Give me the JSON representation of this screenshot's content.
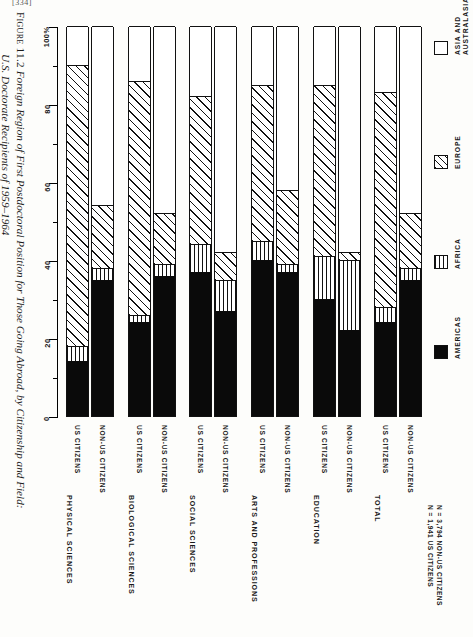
{
  "page_number": "[334]",
  "caption": {
    "figure_label": "Figure 11.2",
    "line1": "Foreign Region of First Postdoctoral Position for Those Going Abroad, by Citizenship and Field:",
    "line2": "U.S. Doctorate Recipients of 1959–1964"
  },
  "notes": {
    "line1": "N = 1,941 US CITIZENS",
    "line2": "N = 3,794 NON-US CITIZENS"
  },
  "legend": {
    "items": [
      {
        "label": "AMERICAS",
        "pattern": "solid-black",
        "color": "#0a0a0a",
        "icon": "legend-swatch-icon"
      },
      {
        "label": "AFRICA",
        "pattern": "vertical-lines",
        "color": "#111111",
        "icon": "legend-swatch-icon"
      },
      {
        "label": "EUROPE",
        "pattern": "diagonal-hatch",
        "color": "#111111",
        "icon": "legend-swatch-icon"
      },
      {
        "label": "ASIA AND AUSTRALASIA",
        "label_l1": "ASIA AND",
        "label_l2": "AUSTRALASIA",
        "pattern": "white",
        "color": "#ffffff",
        "icon": "legend-swatch-icon"
      }
    ]
  },
  "chart_data": {
    "type": "bar",
    "subtype": "stacked-bar-100-percent",
    "orientation": "vertical",
    "title": "Foreign Region of First Postdoctoral Position for Those Going Abroad, by Citizenship and Field: U.S. Doctorate Recipients of 1959–1964",
    "xlabel": "",
    "ylabel": "",
    "ylim": [
      0,
      100
    ],
    "yticks": [
      0,
      20,
      40,
      60,
      80,
      100
    ],
    "ytick_labels": [
      "0",
      "20",
      "40",
      "60",
      "80",
      "100%"
    ],
    "yminor_ticks": [
      10,
      30,
      50,
      70,
      90
    ],
    "grid": false,
    "legend_position": "right",
    "series": [
      {
        "name": "AMERICAS",
        "values": [
          14,
          35,
          24,
          36,
          37,
          27,
          40,
          37,
          30,
          22,
          24,
          35
        ]
      },
      {
        "name": "AFRICA",
        "values": [
          4,
          3,
          2,
          3,
          7,
          8,
          5,
          2,
          11,
          18,
          4,
          3
        ]
      },
      {
        "name": "EUROPE",
        "values": [
          72,
          16,
          60,
          13,
          38,
          7,
          40,
          19,
          44,
          2,
          55,
          14
        ]
      },
      {
        "name": "ASIA AND AUSTRALASIA",
        "values": [
          10,
          46,
          14,
          48,
          18,
          58,
          15,
          42,
          15,
          58,
          17,
          48
        ]
      }
    ],
    "categories": [
      "PHYSICAL SCIENCES / US CITIZENS",
      "PHYSICAL SCIENCES / NON-US CITIZENS",
      "BIOLOGICAL SCIENCES / US CITIZENS",
      "BIOLOGICAL SCIENCES / NON-US CITIZENS",
      "SOCIAL SCIENCES / US CITIZENS",
      "SOCIAL SCIENCES / NON-US CITIZENS",
      "ARTS AND PROFESSIONS / US CITIZENS",
      "ARTS AND PROFESSIONS / NON-US CITIZENS",
      "EDUCATION / US CITIZENS",
      "EDUCATION / NON-US CITIZENS",
      "TOTAL / US CITIZENS",
      "TOTAL / NON-US CITIZENS"
    ],
    "groups": [
      {
        "label": "PHYSICAL SCIENCES",
        "bars": [
          {
            "label": "US CITIZENS",
            "americas": 14,
            "africa": 4,
            "europe": 72,
            "asia": 10
          },
          {
            "label": "NON-US CITIZENS",
            "americas": 35,
            "africa": 3,
            "europe": 16,
            "asia": 46
          }
        ]
      },
      {
        "label": "BIOLOGICAL SCIENCES",
        "bars": [
          {
            "label": "US CITIZENS",
            "americas": 24,
            "africa": 2,
            "europe": 60,
            "asia": 14
          },
          {
            "label": "NON-US CITIZENS",
            "americas": 36,
            "africa": 3,
            "europe": 13,
            "asia": 48
          }
        ]
      },
      {
        "label": "SOCIAL SCIENCES",
        "bars": [
          {
            "label": "US CITIZENS",
            "americas": 37,
            "africa": 7,
            "europe": 38,
            "asia": 18
          },
          {
            "label": "NON-US CITIZENS",
            "americas": 27,
            "africa": 8,
            "europe": 7,
            "asia": 58
          }
        ]
      },
      {
        "label": "ARTS AND PROFESSIONS",
        "bars": [
          {
            "label": "US CITIZENS",
            "americas": 40,
            "africa": 5,
            "europe": 40,
            "asia": 15
          },
          {
            "label": "NON-US CITIZENS",
            "americas": 37,
            "africa": 2,
            "europe": 19,
            "asia": 42
          }
        ]
      },
      {
        "label": "EDUCATION",
        "bars": [
          {
            "label": "US CITIZENS",
            "americas": 30,
            "africa": 11,
            "europe": 44,
            "asia": 15
          },
          {
            "label": "NON-US CITIZENS",
            "americas": 22,
            "africa": 18,
            "europe": 2,
            "asia": 58
          }
        ]
      },
      {
        "label": "TOTAL",
        "bars": [
          {
            "label": "US CITIZENS",
            "americas": 24,
            "africa": 4,
            "europe": 55,
            "asia": 17
          },
          {
            "label": "NON-US CITIZENS",
            "americas": 35,
            "africa": 3,
            "europe": 14,
            "asia": 48
          }
        ]
      }
    ]
  }
}
